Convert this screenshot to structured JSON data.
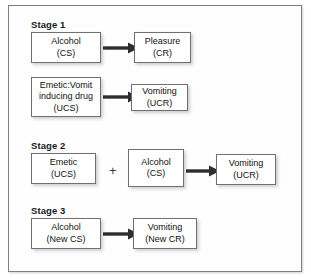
{
  "diagram": {
    "title_visible": false,
    "frame_border_color": "#7d7d82",
    "box_border_color": "#6f6f74",
    "arrow_color": "#2e2e32",
    "stages": [
      {
        "label": "Stage 1",
        "rows": [
          {
            "source": {
              "l1": "Alcohol",
              "l2": "(CS)"
            },
            "target": {
              "l1": "Pleasure",
              "l2": "(CR)"
            },
            "arrow": "arrow-right"
          },
          {
            "source": {
              "l1": "Emetic:Vomit",
              "l2": "inducing drug",
              "l3": "(UCS)"
            },
            "target": {
              "l1": "Vomiting",
              "l2": "(UCR)"
            },
            "arrow": "arrow-right"
          }
        ]
      },
      {
        "label": "Stage 2",
        "rows": [
          {
            "source": {
              "l1": "Emetic",
              "l2": "(UCS)"
            },
            "operator": "+",
            "second": {
              "l1": "Alcohol",
              "l2": "(CS)"
            },
            "target": {
              "l1": "Vomiting",
              "l2": "(UCR)"
            },
            "arrow": "arrow-right"
          }
        ]
      },
      {
        "label": "Stage 3",
        "rows": [
          {
            "source": {
              "l1": "Alcohol",
              "l2": "(New CS)"
            },
            "target": {
              "l1": "Vomiting",
              "l2": "(New CR)"
            },
            "arrow": "arrow-right"
          }
        ]
      }
    ]
  }
}
